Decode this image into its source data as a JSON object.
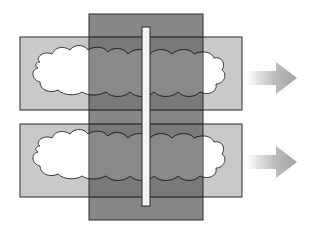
{
  "diagram": {
    "colors": {
      "background": "#ffffff",
      "light_band": "#c9c9c9",
      "dark_panel": "#7a7a7a",
      "overlap": "#5f5f5f",
      "cloud": "#ffffff",
      "slit": "#f4f4f4",
      "outline": "#2a2a2a",
      "arrow": "#a8a8a8"
    },
    "bands": [
      {
        "id": "top",
        "x": 20,
        "y": 37,
        "w": 222,
        "h": 73
      },
      {
        "id": "bottom",
        "x": 20,
        "y": 124,
        "w": 222,
        "h": 73
      }
    ],
    "dark_panel": {
      "x": 89,
      "y": 14,
      "w": 114,
      "h": 206
    },
    "slit": {
      "x": 142,
      "y": 27,
      "w": 8,
      "h": 179
    },
    "arrows": [
      {
        "id": "top-arrow",
        "x": 246,
        "y": 78
      },
      {
        "id": "bottom-arrow",
        "x": 246,
        "y": 162
      }
    ]
  }
}
